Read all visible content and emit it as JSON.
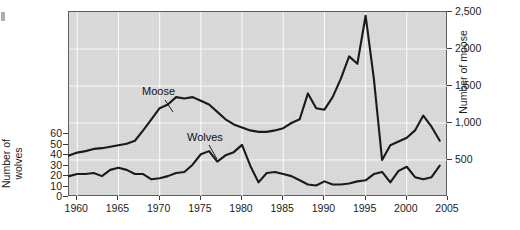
{
  "chart_data": {
    "type": "line",
    "title": "",
    "xlabel": "",
    "ylabel_left": "Number of\nwolves",
    "ylabel_right": "Number of moose",
    "xlim": [
      1959,
      2005
    ],
    "xticks": [
      "1960",
      "1965",
      "1970",
      "1975",
      "1980",
      "1985",
      "1990",
      "1995",
      "2000",
      "2005"
    ],
    "xtick_values": [
      1960,
      1965,
      1970,
      1975,
      1980,
      1985,
      1990,
      1995,
      2000,
      2005
    ],
    "ylim_left": [
      0,
      70
    ],
    "yticks_left": [
      "0",
      "10",
      "20",
      "30",
      "40",
      "50",
      "60"
    ],
    "ytick_values_left": [
      0,
      10,
      20,
      30,
      40,
      50,
      60
    ],
    "ylim_right": [
      0,
      2500
    ],
    "yticks_right": [
      "500",
      "1,000",
      "1,500",
      "2,000",
      "2,500"
    ],
    "ytick_values_right": [
      500,
      1000,
      1500,
      2000,
      2500
    ],
    "grid": true,
    "legend_position": "inline-annotations",
    "series": [
      {
        "name": "Moose",
        "axis": "right",
        "label": "Moose",
        "x": [
          1959,
          1960,
          1961,
          1962,
          1963,
          1964,
          1965,
          1966,
          1967,
          1968,
          1969,
          1970,
          1971,
          1972,
          1973,
          1974,
          1975,
          1976,
          1977,
          1978,
          1979,
          1980,
          1981,
          1982,
          1983,
          1984,
          1985,
          1986,
          1987,
          1988,
          1989,
          1990,
          1991,
          1992,
          1993,
          1994,
          1995,
          1996,
          1997,
          1998,
          1999,
          2000,
          2001,
          2002,
          2003,
          2004
        ],
        "values": [
          560,
          600,
          620,
          650,
          660,
          680,
          700,
          720,
          760,
          900,
          1050,
          1200,
          1250,
          1350,
          1330,
          1350,
          1300,
          1250,
          1150,
          1050,
          980,
          940,
          900,
          880,
          880,
          900,
          930,
          1000,
          1050,
          1400,
          1200,
          1180,
          1350,
          1600,
          1900,
          1800,
          2450,
          1600,
          500,
          700,
          750,
          800,
          900,
          1100,
          950,
          760
        ]
      },
      {
        "name": "Wolves",
        "axis": "left",
        "label": "Wolves",
        "x": [
          1959,
          1960,
          1961,
          1962,
          1963,
          1964,
          1965,
          1966,
          1967,
          1968,
          1969,
          1970,
          1971,
          1972,
          1973,
          1974,
          1975,
          1976,
          1977,
          1978,
          1979,
          1980,
          1981,
          1982,
          1983,
          1984,
          1985,
          1986,
          1987,
          1988,
          1989,
          1990,
          1991,
          1992,
          1993,
          1994,
          1995,
          1996,
          1997,
          1998,
          1999,
          2000,
          2001,
          2002,
          2003,
          2004
        ],
        "values": [
          20,
          22,
          22,
          23,
          20,
          26,
          28,
          26,
          22,
          22,
          17,
          18,
          20,
          23,
          24,
          31,
          41,
          44,
          34,
          40,
          43,
          50,
          30,
          14,
          23,
          24,
          22,
          20,
          16,
          12,
          11,
          15,
          12,
          12,
          13,
          15,
          16,
          22,
          24,
          14,
          25,
          29,
          19,
          17,
          19,
          30
        ]
      }
    ],
    "annotations": [
      {
        "text": "Moose",
        "x": 1968.0,
        "y_right": 1750
      },
      {
        "text": "Wolves",
        "x": 1976.5,
        "y_right": 1180
      }
    ],
    "colors": {
      "plot_background": "#dcdcdc",
      "grid": "#ffffff",
      "line": "#1a1a1a",
      "frame": "#5d5d5d"
    }
  }
}
